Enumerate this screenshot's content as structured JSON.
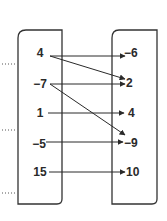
{
  "diagram": {
    "type": "mapping",
    "domain": [
      "4",
      "−7",
      "1",
      "−5",
      "15"
    ],
    "range": [
      "−6",
      "2",
      "4",
      "−9",
      "10"
    ],
    "mappings": [
      {
        "from": "4",
        "to": "−6"
      },
      {
        "from": "4",
        "to": "2"
      },
      {
        "from": "−7",
        "to": "2"
      },
      {
        "from": "−7",
        "to": "−9"
      },
      {
        "from": "1",
        "to": "4"
      },
      {
        "from": "−5",
        "to": "−9"
      },
      {
        "from": "15",
        "to": "10"
      }
    ],
    "colors": {
      "stroke": "#2a2a2a",
      "background": "#ffffff"
    }
  }
}
